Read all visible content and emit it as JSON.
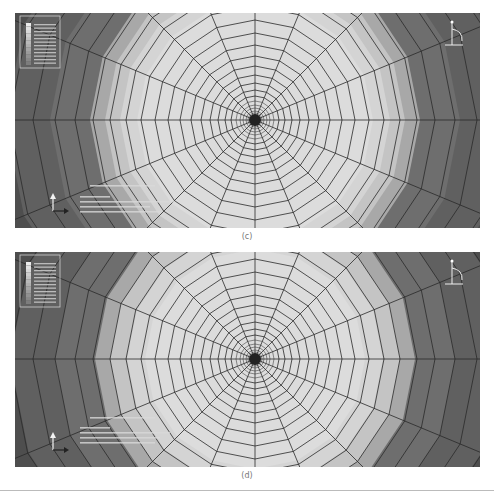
{
  "figures": [
    {
      "id": "c",
      "caption": "(c)",
      "legend_label": "contour legend",
      "annotation_lines": [
        "ODB: ...",
        "Step: ...",
        "Increment ...",
        "Primary Var: ..."
      ]
    },
    {
      "id": "d",
      "caption": "(d)",
      "legend_label": "contour legend",
      "annotation_lines": [
        "ODB: ...",
        "Step: ...",
        "Increment ...",
        "Primary Var: ..."
      ]
    }
  ],
  "colors": {
    "band_outer": "#4e4e4e",
    "band_2": "#606060",
    "band_3": "#6e6e6e",
    "band_4": "#a8a8a8",
    "band_5": "#c4c4c4",
    "band_6": "#d4d4d4",
    "band_inner": "#dcdcdc",
    "mesh_line": "#2a2a2a"
  },
  "icons": {
    "legend": "contour-legend-icon",
    "triad": "axis-triad-icon",
    "view_cube": "view-orientation-icon"
  }
}
